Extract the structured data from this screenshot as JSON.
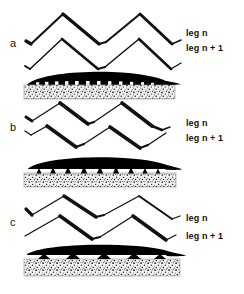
{
  "figure": {
    "background_color": "#ffffff",
    "ink_color": "#111111",
    "substrate_fill": "#b8b8b8",
    "blade_color": "#000000",
    "panels": [
      {
        "letter": "a",
        "leg_n_label": "leg n",
        "leg_n1_label": "leg n + 1",
        "description": "In-phase zigzag legs above a flat black blade resting directly on stippled substrate",
        "zigzag_cycles": 2,
        "contact_gap": "none",
        "support_count": 0
      },
      {
        "letter": "b",
        "leg_n_label": "leg n",
        "leg_n1_label": "leg n + 1",
        "description": "Out-of-phase zigzag legs above a black blade raised on narrow triangular supports",
        "zigzag_cycles": 2,
        "contact_gap": "narrow",
        "support_count": 9
      },
      {
        "letter": "c",
        "leg_n_label": "leg n",
        "leg_n1_label": "leg n + 1",
        "description": "Long wavelength zigzag legs above a black blade raised on wide triangular supports",
        "zigzag_cycles": 2,
        "contact_gap": "wide",
        "support_count": 5
      }
    ]
  }
}
